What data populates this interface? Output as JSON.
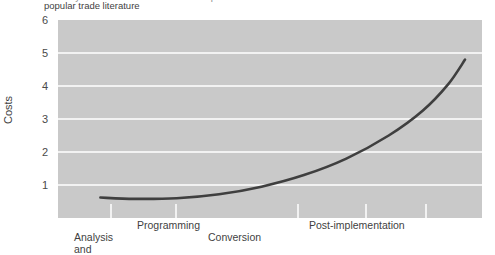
{
  "figure": {
    "caption_visible_line": "popular trade literature",
    "caption_clipped_line": "of the system. A similar breakdown is reported in the"
  },
  "chart_data": {
    "type": "line",
    "title": "",
    "xlabel": "",
    "ylabel": "Costs",
    "ylim": [
      0,
      6
    ],
    "yticks": [
      6,
      5,
      4,
      3,
      2,
      1
    ],
    "grid": true,
    "legend": false,
    "plot_background": "#c9c9c9",
    "gridline_color": "#f2f2f2",
    "line_color": "#3f3f3f",
    "x_phase_labels": [
      {
        "text": "Analysis\nand",
        "row": "bottom"
      },
      {
        "text": "Programming",
        "row": "top"
      },
      {
        "text": "Conversion",
        "row": "bottom"
      },
      {
        "text": "Post-implementation",
        "row": "top"
      }
    ],
    "series": [
      {
        "name": "Costs over system life cycle",
        "points": [
          {
            "x": 0.1,
            "y": 0.62
          },
          {
            "x": 0.18,
            "y": 0.58
          },
          {
            "x": 0.28,
            "y": 0.6
          },
          {
            "x": 0.38,
            "y": 0.72
          },
          {
            "x": 0.48,
            "y": 0.95
          },
          {
            "x": 0.58,
            "y": 1.3
          },
          {
            "x": 0.68,
            "y": 1.8
          },
          {
            "x": 0.78,
            "y": 2.5
          },
          {
            "x": 0.86,
            "y": 3.25
          },
          {
            "x": 0.92,
            "y": 4.05
          },
          {
            "x": 0.96,
            "y": 4.8
          }
        ]
      }
    ]
  }
}
